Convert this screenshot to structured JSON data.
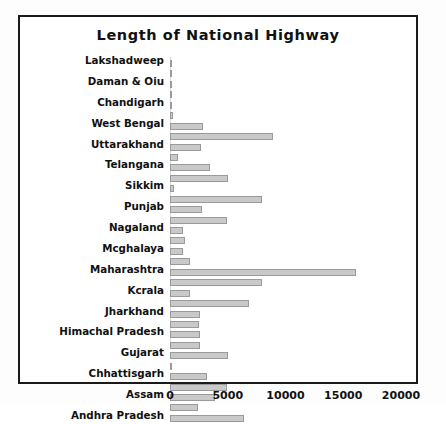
{
  "figure": {
    "title": "Length of National Highway",
    "frame_color": "#1a1a1a",
    "background": "#ffffff",
    "bar_fill": "#c9c9c9",
    "bar_stroke": "#9a9a9a"
  },
  "chart_data": {
    "type": "bar",
    "orientation": "horizontal",
    "title": "Length of National Highway",
    "xlabel": "",
    "ylabel": "",
    "xlim": [
      0,
      20000
    ],
    "xticks": [
      "0",
      "5000",
      "10000",
      "15000",
      "20000"
    ],
    "xtick_values": [
      0,
      5000,
      10000,
      15000,
      20000
    ],
    "grid": false,
    "legend": null,
    "categories": [
      "Lakshadweep",
      "Daman & Oiu",
      "Chandigarh",
      "West Bengal",
      "Uttarakhand",
      "Telangana",
      "Sikkim",
      "Punjab",
      "Nagaland",
      "Mcghalaya",
      "Maharashtra",
      "Kcrala",
      "Jharkhand",
      "Himachal Pradesh",
      "Gujarat",
      "Chhattisgarh",
      "Assam",
      "Andhra Pradesh"
    ],
    "rows": [
      {
        "label": "Lakshadweep",
        "labeled": true,
        "value": 30
      },
      {
        "label": "",
        "labeled": false,
        "value": 20
      },
      {
        "label": "Daman & Oiu",
        "labeled": true,
        "value": 30
      },
      {
        "label": "",
        "labeled": false,
        "value": 20
      },
      {
        "label": "Chandigarh",
        "labeled": true,
        "value": 25
      },
      {
        "label": "",
        "labeled": false,
        "value": 250
      },
      {
        "label": "West Bengal",
        "labeled": true,
        "value": 2900
      },
      {
        "label": "",
        "labeled": false,
        "value": 8900
      },
      {
        "label": "Uttarakhand",
        "labeled": true,
        "value": 2700
      },
      {
        "label": "",
        "labeled": false,
        "value": 700
      },
      {
        "label": "Telangana",
        "labeled": true,
        "value": 3500
      },
      {
        "label": "",
        "labeled": false,
        "value": 5000
      },
      {
        "label": "Sikkim",
        "labeled": true,
        "value": 350
      },
      {
        "label": "",
        "labeled": false,
        "value": 8000
      },
      {
        "label": "Punjab",
        "labeled": true,
        "value": 2800
      },
      {
        "label": "",
        "labeled": false,
        "value": 4900
      },
      {
        "label": "Nagaland",
        "labeled": true,
        "value": 1150
      },
      {
        "label": "",
        "labeled": false,
        "value": 1300
      },
      {
        "label": "Mcghalaya",
        "labeled": true,
        "value": 1150
      },
      {
        "label": "",
        "labeled": false,
        "value": 1700
      },
      {
        "label": "Maharashtra",
        "labeled": true,
        "value": 16100
      },
      {
        "label": "",
        "labeled": false,
        "value": 8000
      },
      {
        "label": "Kcrala",
        "labeled": true,
        "value": 1700
      },
      {
        "label": "",
        "labeled": false,
        "value": 6800
      },
      {
        "label": "Jharkhand",
        "labeled": true,
        "value": 2600
      },
      {
        "label": "",
        "labeled": false,
        "value": 2500
      },
      {
        "label": "Himachal Pradesh",
        "labeled": true,
        "value": 2600
      },
      {
        "label": "",
        "labeled": false,
        "value": 2600
      },
      {
        "label": "Gujarat",
        "labeled": true,
        "value": 5000
      },
      {
        "label": "",
        "labeled": false,
        "value": 150
      },
      {
        "label": "Chhattisgarh",
        "labeled": true,
        "value": 3200
      },
      {
        "label": "",
        "labeled": false,
        "value": 4900
      },
      {
        "label": "Assam",
        "labeled": true,
        "value": 3900
      },
      {
        "label": "",
        "labeled": false,
        "value": 2400
      },
      {
        "label": "Andhra Pradesh",
        "labeled": true,
        "value": 6400
      }
    ]
  }
}
